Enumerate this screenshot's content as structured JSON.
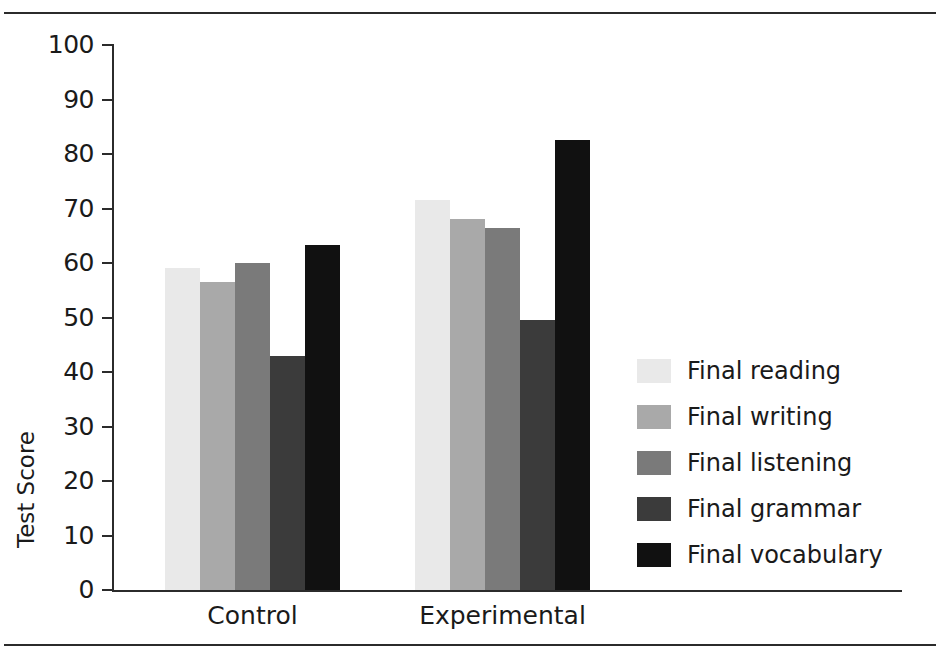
{
  "chart_data": {
    "type": "bar",
    "title": "",
    "subtitle": "",
    "xlabel": "",
    "ylabel": "Test Score",
    "ylim": [
      0,
      100
    ],
    "yticks": [
      0,
      10,
      20,
      30,
      40,
      50,
      60,
      70,
      80,
      90,
      100
    ],
    "ytick_labels": [
      "0",
      "10",
      "20",
      "30",
      "40",
      "50",
      "60",
      "70",
      "80",
      "90",
      "100"
    ],
    "grid": false,
    "legend_position": "right",
    "categories": [
      "Control",
      "Experimental"
    ],
    "series": [
      {
        "name": "Final reading",
        "color": "#e9e9e9",
        "values": [
          59.0,
          71.5
        ]
      },
      {
        "name": "Final writing",
        "color": "#a9a9a9",
        "values": [
          56.5,
          68.0
        ]
      },
      {
        "name": "Final listening",
        "color": "#7a7a7a",
        "values": [
          60.0,
          66.5
        ]
      },
      {
        "name": "Final grammar",
        "color": "#3b3b3b",
        "values": [
          43.0,
          49.5
        ]
      },
      {
        "name": "Final vocabulary",
        "color": "#111111",
        "values": [
          63.3,
          82.5
        ]
      }
    ]
  },
  "axes": {
    "y_axis_label": "Test Score"
  },
  "colors": {
    "axis": "#2b2b2b",
    "text": "#1a1a1a",
    "background": "#ffffff",
    "rule": "#2b2b2b"
  }
}
